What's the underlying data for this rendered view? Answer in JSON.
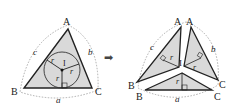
{
  "diagram": {
    "colors": {
      "fill": "#d9d9d9",
      "stroke": "#222222",
      "dotted": "#999999",
      "arrow": "#444444"
    },
    "left": {
      "vertices": {
        "A": "A",
        "B": "B",
        "C": "C"
      },
      "sides": {
        "a": "a",
        "b": "b",
        "c": "c"
      },
      "incenter": "I",
      "radius_label": "r"
    },
    "arrow": "➡",
    "right": {
      "vertices": {
        "A1": "A",
        "A2": "A",
        "B1": "B",
        "B2": "B",
        "C1": "C",
        "C2": "C"
      },
      "sides": {
        "a": "a",
        "b": "b",
        "c": "c"
      },
      "incenter": "I",
      "radius_label": "r"
    }
  }
}
